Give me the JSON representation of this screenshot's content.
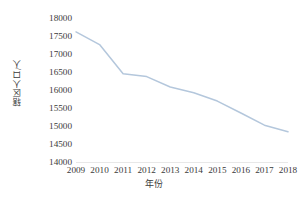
{
  "chart_data": {
    "type": "line",
    "title": "",
    "xlabel": "年份",
    "ylabel": "辖区人口/人",
    "categories": [
      "2009",
      "2010",
      "2011",
      "2012",
      "2013",
      "2014",
      "2015",
      "2016",
      "2017",
      "2018"
    ],
    "x": [
      2009,
      2010,
      2011,
      2012,
      2013,
      2014,
      2015,
      2016,
      2017,
      2018
    ],
    "values": [
      17640,
      17290,
      16480,
      16400,
      16110,
      15950,
      15720,
      15390,
      15050,
      14870
    ],
    "series": [
      {
        "name": "辖区人口",
        "values": [
          17640,
          17290,
          16480,
          16400,
          16110,
          15950,
          15720,
          15390,
          15050,
          14870
        ]
      }
    ],
    "ylim": [
      14000,
      18000
    ],
    "ytick_step": 500,
    "ytick_labels": [
      "18000",
      "17500",
      "17000",
      "16500",
      "16000",
      "15500",
      "15000",
      "14500",
      "14000"
    ],
    "ytick_values": [
      18000,
      17500,
      17000,
      16500,
      16000,
      15500,
      15000,
      14500,
      14000
    ],
    "grid": false,
    "legend": false,
    "legend_position": "none",
    "line_color": "#b4c7dc",
    "axis_color": "#e8e8e8",
    "text_color": "#3a3a3a",
    "background": "#ffffff"
  }
}
